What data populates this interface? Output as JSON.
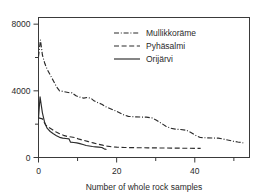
{
  "chart_data": {
    "type": "line",
    "title": "",
    "xlabel": "Number of whole rock samples",
    "ylabel": "",
    "xlim": [
      0,
      54
    ],
    "ylim": [
      0,
      8400
    ],
    "x_ticks_major": [
      0,
      20,
      40
    ],
    "x_ticks_minor": [
      10,
      30,
      50
    ],
    "y_ticks_major": [
      0,
      4000,
      8000
    ],
    "y_ticks_minor": [
      2000,
      6000
    ],
    "x_tick_labels": [
      "0",
      "20",
      "40"
    ],
    "y_tick_labels": [
      "0",
      "4000",
      "8000"
    ],
    "grid": false,
    "legend_position": "top-center",
    "series": [
      {
        "name": "Mullikkoräme",
        "linestyle": "dash-dot",
        "color": "#2b2b2b",
        "points": [
          [
            0,
            6050
          ],
          [
            0.5,
            7050
          ],
          [
            1,
            6150
          ],
          [
            1.6,
            5650
          ],
          [
            2.2,
            5300
          ],
          [
            3,
            4950
          ],
          [
            3.8,
            4600
          ],
          [
            4.6,
            4250
          ],
          [
            5.4,
            4000
          ],
          [
            6.4,
            3960
          ],
          [
            7.6,
            3900
          ],
          [
            8.6,
            3880
          ],
          [
            9.6,
            3700
          ],
          [
            10.6,
            3620
          ],
          [
            11.6,
            3560
          ],
          [
            12.4,
            3600
          ],
          [
            13.4,
            3560
          ],
          [
            14.2,
            3400
          ],
          [
            15.2,
            3290
          ],
          [
            16.2,
            3200
          ],
          [
            17.2,
            3050
          ],
          [
            18.4,
            2930
          ],
          [
            19.4,
            2830
          ],
          [
            20.6,
            2700
          ],
          [
            21.8,
            2560
          ],
          [
            23,
            2470
          ],
          [
            24.4,
            2440
          ],
          [
            26,
            2430
          ],
          [
            27.6,
            2420
          ],
          [
            29,
            2380
          ],
          [
            30.2,
            2240
          ],
          [
            31.4,
            2060
          ],
          [
            32.6,
            1880
          ],
          [
            33.8,
            1760
          ],
          [
            35,
            1700
          ],
          [
            36.4,
            1680
          ],
          [
            37.8,
            1640
          ],
          [
            39,
            1500
          ],
          [
            40.2,
            1330
          ],
          [
            41.4,
            1200
          ],
          [
            43,
            1180
          ],
          [
            44.6,
            1170
          ],
          [
            46,
            1160
          ],
          [
            47.2,
            1110
          ],
          [
            48.4,
            1050
          ],
          [
            49.8,
            980
          ],
          [
            51,
            930
          ],
          [
            52.4,
            880
          ]
        ]
      },
      {
        "name": "Pyhäsalmi",
        "linestyle": "dashed",
        "color": "#2b2b2b",
        "points": [
          [
            0,
            2380
          ],
          [
            1,
            2320
          ],
          [
            1.8,
            1960
          ],
          [
            2.6,
            1810
          ],
          [
            3.4,
            1700
          ],
          [
            4.4,
            1540
          ],
          [
            5.4,
            1430
          ],
          [
            6.4,
            1330
          ],
          [
            7.4,
            1260
          ],
          [
            8.4,
            1230
          ],
          [
            9.4,
            1190
          ],
          [
            10.4,
            1100
          ],
          [
            11.6,
            1030
          ],
          [
            12.8,
            950
          ],
          [
            14,
            880
          ],
          [
            15.2,
            800
          ],
          [
            16.4,
            740
          ],
          [
            17.6,
            680
          ],
          [
            18.8,
            640
          ],
          [
            20,
            620
          ],
          [
            22,
            600
          ],
          [
            24,
            590
          ],
          [
            26,
            585
          ],
          [
            28,
            580
          ],
          [
            30,
            575
          ],
          [
            32,
            570
          ],
          [
            34,
            565
          ],
          [
            36,
            560
          ],
          [
            38,
            555
          ],
          [
            40,
            550
          ],
          [
            41.5,
            545
          ]
        ]
      },
      {
        "name": "Orijärvi",
        "linestyle": "solid",
        "color": "#2b2b2b",
        "points": [
          [
            0,
            2360
          ],
          [
            0.4,
            3640
          ],
          [
            1,
            2680
          ],
          [
            1.6,
            2080
          ],
          [
            2.2,
            1760
          ],
          [
            3,
            1560
          ],
          [
            3.8,
            1420
          ],
          [
            4.6,
            1310
          ],
          [
            5.4,
            1210
          ],
          [
            6.2,
            1160
          ],
          [
            7,
            1140
          ],
          [
            7.8,
            1120
          ],
          [
            8.2,
            920
          ],
          [
            9,
            900
          ],
          [
            9.8,
            880
          ],
          [
            10.6,
            830
          ],
          [
            11.4,
            780
          ],
          [
            12.2,
            720
          ],
          [
            13,
            690
          ],
          [
            13.8,
            660
          ],
          [
            14.6,
            640
          ],
          [
            15.4,
            620
          ],
          [
            16.2,
            600
          ],
          [
            16.8,
            520
          ],
          [
            17.4,
            480
          ]
        ]
      }
    ]
  },
  "legend": {
    "entries": [
      {
        "label": "Mullikkoräme",
        "style": "dash-dot"
      },
      {
        "label": "Pyhäsalmi",
        "style": "dashed"
      },
      {
        "label": "Orijärvi",
        "style": "solid"
      }
    ]
  },
  "axes": {
    "x_label": "Number of whole rock samples"
  },
  "artifact": {
    "top_text": ""
  }
}
